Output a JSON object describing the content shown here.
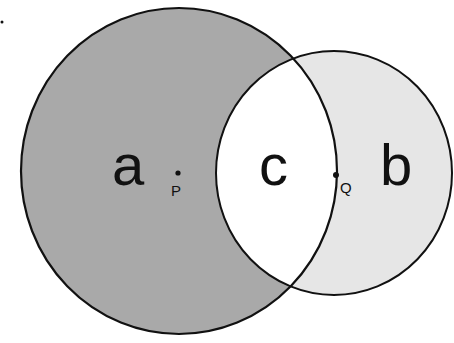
{
  "diagram": {
    "type": "venn",
    "colors": {
      "region_a": "#a9a9a9",
      "region_b": "#e6e6e6",
      "region_c": "#ffffff",
      "stroke": "#111111"
    },
    "regions": {
      "a": "a",
      "b": "b",
      "c": "c"
    },
    "points": {
      "p": "P",
      "q": "Q"
    }
  }
}
